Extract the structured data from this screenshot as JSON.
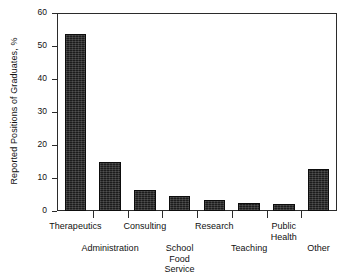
{
  "chart_data": {
    "type": "bar",
    "title": "",
    "xlabel": "",
    "ylabel": "Reported Positions of Graduates, %",
    "ylim": [
      0,
      60
    ],
    "yticks": [
      0,
      10,
      20,
      30,
      40,
      50,
      60
    ],
    "ytick_labels": [
      "0",
      "10",
      "20",
      "30",
      "40",
      "50",
      "60"
    ],
    "grid": false,
    "legend": null,
    "categories": [
      "Therapeutics",
      "Administration",
      "Consulting",
      "School Food Service",
      "Research",
      "Teaching",
      "Public Health",
      "Other"
    ],
    "category_labels": [
      "Therapeutics",
      "Administration",
      "Consulting",
      "School\nFood\nService",
      "Research",
      "Teaching",
      "Public\nHealth",
      "Other"
    ],
    "values": [
      54,
      15,
      6.5,
      4.7,
      3.5,
      2.3,
      2,
      12.8
    ],
    "bar_color": "#1c1c1c",
    "axis_color": "#2b2b2b",
    "background_color": "#ffffff"
  },
  "axis": {
    "y_title": "Reported Positions of Graduates, %"
  }
}
